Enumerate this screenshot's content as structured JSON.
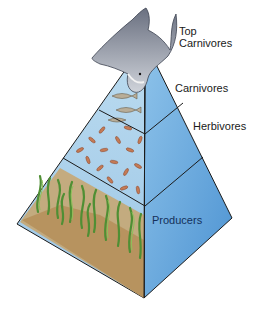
{
  "diagram": {
    "type": "trophic-pyramid",
    "levels": [
      {
        "id": "top-carnivores",
        "label_line1": "Top",
        "label_line2": "Carnivores",
        "icon": "shark-icon"
      },
      {
        "id": "carnivores",
        "label": "Carnivores",
        "icon": "fish-icon"
      },
      {
        "id": "herbivores",
        "label": "Herbivores",
        "icon": "zooplankton-icon"
      },
      {
        "id": "producers",
        "label": "Producers",
        "icon": "seagrass-icon"
      }
    ],
    "colors": {
      "left_face": "#a9cfe9",
      "right_face": "#5fa3da",
      "outline": "#1b1b1b",
      "sediment": "#c9a46a",
      "plants": "#5e9a3a"
    }
  }
}
